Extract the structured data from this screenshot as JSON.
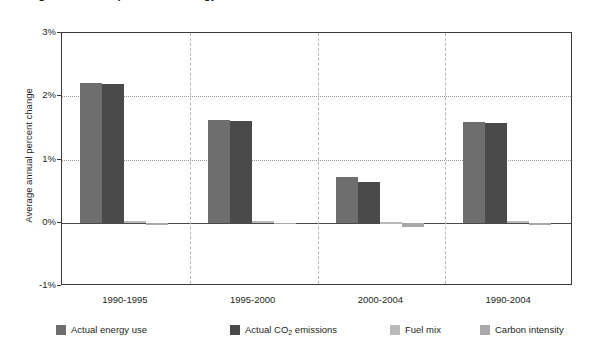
{
  "figure": {
    "title_clipped": "Figure 2. Decomposition of energy-related carbon dioxide emissions",
    "background": "#ffffff"
  },
  "chart_data": {
    "type": "bar",
    "title": "",
    "xlabel": "",
    "ylabel": "Average annual percent change",
    "categories": [
      "1990-1995",
      "1995-2000",
      "2000-2004",
      "1990-2004"
    ],
    "ylim": [
      -1,
      3
    ],
    "ytick_labels": [
      "3%",
      "2%",
      "1%",
      "0%",
      "-1%"
    ],
    "ytick_values": [
      3,
      2,
      1,
      0,
      -1
    ],
    "gridlines": [
      2,
      1
    ],
    "zero_line": 0,
    "grid": true,
    "legend_position": "bottom",
    "series": [
      {
        "name": "Actual energy use",
        "color": "#6e6e6e",
        "values": [
          2.21,
          1.62,
          0.72,
          1.6
        ]
      },
      {
        "name": "Actual CO2 emissions",
        "color": "#4a4a4a",
        "values": [
          2.19,
          1.61,
          0.65,
          1.57
        ]
      },
      {
        "name": "Fuel mix",
        "color": "#b9b9b9",
        "values": [
          0.02,
          0.02,
          0.01,
          0.02
        ]
      },
      {
        "name": "Carbon intensity",
        "color": "#a9a9a9",
        "values": [
          -0.03,
          -0.02,
          -0.07,
          -0.03
        ]
      }
    ]
  },
  "yticks": [
    {
      "label": "3%"
    },
    {
      "label": "2%"
    },
    {
      "label": "1%"
    },
    {
      "label": "0%"
    },
    {
      "label": "-1%"
    }
  ],
  "xticks": [
    {
      "label": "1990-1995"
    },
    {
      "label": "1995-2000"
    },
    {
      "label": "2000-2004"
    },
    {
      "label": "1990-2004"
    }
  ],
  "legend": {
    "items": [
      {
        "label": "Actual energy use",
        "color": "#6e6e6e"
      },
      {
        "label_pre": "Actual CO",
        "label_sub": "2",
        "label_post": " emissions",
        "color": "#4a4a4a"
      },
      {
        "label": "Fuel mix",
        "color": "#b9b9b9"
      },
      {
        "label": "Carbon intensity",
        "color": "#a9a9a9"
      }
    ]
  }
}
